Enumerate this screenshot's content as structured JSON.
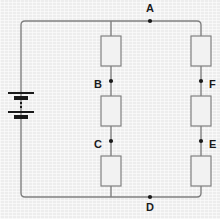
{
  "figure": {
    "background_color": "#ededed",
    "wire_color": "#808080",
    "component_stroke_color": "#808080",
    "resistor_fill_color": "#f2f2f2",
    "battery_color": "#1a1a1a",
    "node_dot_color": "#1a1a1a",
    "label_color": "#1b1b1b"
  },
  "nodes": [
    {
      "id": "A",
      "label": "A",
      "x": 150,
      "y": 21,
      "label_x": 150,
      "label_y": 12,
      "label_anchor": "middle"
    },
    {
      "id": "B",
      "label": "B",
      "x": 111,
      "y": 81,
      "label_x": 102,
      "label_y": 85,
      "label_anchor": "end"
    },
    {
      "id": "C",
      "label": "C",
      "x": 111,
      "y": 141,
      "label_x": 102,
      "label_y": 145,
      "label_anchor": "end"
    },
    {
      "id": "D",
      "label": "D",
      "x": 150,
      "y": 197,
      "label_x": 150,
      "label_y": 211,
      "label_anchor": "middle"
    },
    {
      "id": "E",
      "label": "E",
      "x": 201,
      "y": 141,
      "label_x": 209,
      "label_y": 145,
      "label_anchor": "start"
    },
    {
      "id": "F",
      "label": "F",
      "x": 201,
      "y": 81,
      "label_x": 209,
      "label_y": 85,
      "label_anchor": "start"
    }
  ],
  "resistors": [
    {
      "id": "R1",
      "branch": "middle",
      "x": 111,
      "y": 51,
      "width": 20,
      "height": 30
    },
    {
      "id": "R2",
      "branch": "middle",
      "x": 111,
      "y": 111,
      "width": 20,
      "height": 30
    },
    {
      "id": "R3",
      "branch": "middle",
      "x": 111,
      "y": 171,
      "width": 20,
      "height": 30
    },
    {
      "id": "R4",
      "branch": "right",
      "x": 201,
      "y": 51,
      "width": 20,
      "height": 30
    },
    {
      "id": "R5",
      "branch": "right",
      "x": 201,
      "y": 111,
      "width": 20,
      "height": 30
    },
    {
      "id": "R6",
      "branch": "right",
      "x": 201,
      "y": 171,
      "width": 20,
      "height": 30
    }
  ],
  "battery": {
    "id": "BAT1",
    "x": 21,
    "y": 105,
    "plates": [
      {
        "type": "long",
        "y": 93,
        "half_width": 13,
        "thickness": 2
      },
      {
        "type": "short",
        "y": 98,
        "half_width": 7,
        "thickness": 4
      },
      {
        "type": "long",
        "y": 112,
        "half_width": 13,
        "thickness": 2
      },
      {
        "type": "short",
        "y": 117,
        "half_width": 7,
        "thickness": 4
      }
    ],
    "gap_dashes": [
      {
        "y": 103,
        "half_width": 1,
        "thickness": 2
      },
      {
        "y": 107,
        "half_width": 1,
        "thickness": 2
      }
    ]
  },
  "wires": {
    "outer_loop": {
      "left_x": 21,
      "right_x": 201,
      "top_y": 21,
      "bottom_y": 197,
      "corner_radius": 4
    },
    "middle_branch": {
      "x": 111,
      "top_y": 21,
      "bottom_y": 197
    }
  }
}
